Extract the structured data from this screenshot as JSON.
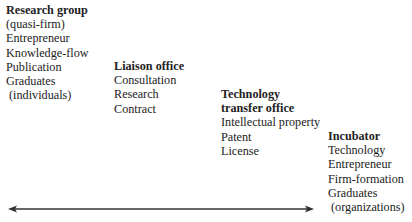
{
  "columns": [
    {
      "title_lines": [
        "Research group"
      ],
      "items": [
        "(quasi-firm)",
        "Entrepreneur",
        "Knowledge-flow",
        "Publication",
        "Graduates",
        " (individuals)"
      ]
    },
    {
      "title_lines": [
        "Liaison office"
      ],
      "items": [
        "Consultation",
        "Research",
        "Contract"
      ]
    },
    {
      "title_lines": [
        "Technology",
        "transfer office"
      ],
      "items": [
        "Intellectual property",
        "Patent",
        "License"
      ]
    },
    {
      "title_lines": [
        "Incubator"
      ],
      "items": [
        "Technology",
        "Entrepreneur",
        "Firm-formation",
        "Graduates",
        " (organizations)"
      ]
    }
  ],
  "arrow": {
    "type": "double-headed",
    "color": "#333333"
  }
}
